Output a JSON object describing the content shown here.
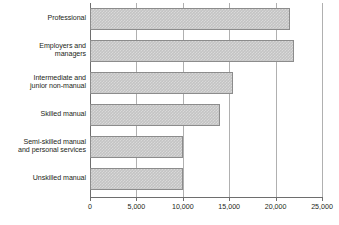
{
  "chart_data": {
    "type": "bar",
    "orientation": "horizontal",
    "title": "",
    "xlabel": "",
    "ylabel": "",
    "xlim": [
      0,
      25000
    ],
    "grid": true,
    "legend": false,
    "categories": [
      "Professional",
      "Employers and\nmanagers",
      "Intermediate and\njunior non-manual",
      "Skilled manual",
      "Semi-skilled manual\nand personal services",
      "Unskilled manual"
    ],
    "values": [
      21550,
      22000,
      15400,
      14000,
      10000,
      10000
    ],
    "xticks": [
      0,
      5000,
      10000,
      15000,
      20000,
      25000
    ],
    "xtick_labels": [
      "0",
      "5,000",
      "10,000",
      "15,000",
      "20,000",
      "25,000"
    ],
    "colors": {
      "bar_fill": "#c4c4c4",
      "bar_border": "#8c8c8c",
      "gridline": "#b0b0b0",
      "axis": "#6e6e6e",
      "text": "#231f20",
      "background": "#ffffff"
    }
  }
}
